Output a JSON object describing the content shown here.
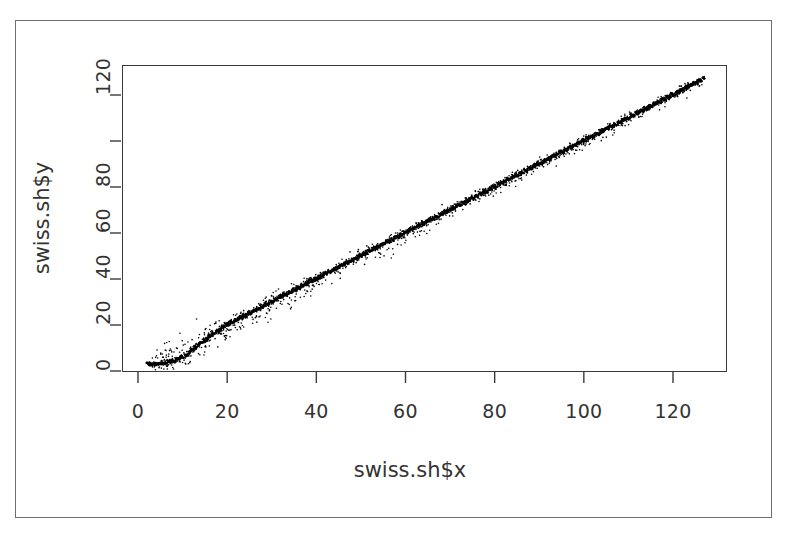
{
  "figure": {
    "background_color": "#ffffff",
    "frame_color": "#6e6e6e",
    "axis_color": "#3a3a3a",
    "point_color": "#000000"
  },
  "chart_data": {
    "type": "scatter",
    "title": "",
    "subtitle": "",
    "xlabel": "swiss.sh$x",
    "ylabel": "swiss.sh$y",
    "xlim": [
      -1,
      131
    ],
    "ylim": [
      -2,
      134
    ],
    "xticks": [
      0,
      20,
      40,
      60,
      80,
      100,
      120
    ],
    "xtick_labels": [
      "0",
      "20",
      "40",
      "60",
      "80",
      "100",
      "120"
    ],
    "yticks": [
      0,
      20,
      40,
      60,
      80,
      100,
      120
    ],
    "ytick_labels": [
      "0",
      "20",
      "40",
      "60",
      "80",
      "",
      "120"
    ],
    "grid": false,
    "legend": null,
    "annotations": [],
    "marker": "point",
    "marker_size_px": 1.6,
    "series": [
      {
        "name": "swiss.sh",
        "color": "#000000",
        "n_points": 1400,
        "x_range": [
          2,
          127
        ],
        "y_range": [
          1,
          127
        ],
        "trend": "linear",
        "slope": 1.0,
        "intercept": 0.0,
        "ridge_points": [
          [
            2,
            3
          ],
          [
            3,
            3
          ],
          [
            4,
            3
          ],
          [
            5,
            3
          ],
          [
            6,
            3
          ],
          [
            7,
            4
          ],
          [
            8,
            4
          ],
          [
            9,
            5
          ],
          [
            10,
            6
          ],
          [
            11,
            7
          ],
          [
            12,
            9
          ],
          [
            13,
            10
          ],
          [
            14,
            12
          ],
          [
            15,
            13
          ],
          [
            16,
            15
          ],
          [
            17,
            16
          ],
          [
            18,
            17
          ],
          [
            19,
            19
          ],
          [
            20,
            20
          ],
          [
            21,
            21
          ],
          [
            22,
            22
          ],
          [
            23,
            23
          ],
          [
            24,
            24
          ],
          [
            25,
            25
          ],
          [
            26,
            26
          ],
          [
            27,
            27
          ],
          [
            28,
            28
          ],
          [
            30,
            30
          ],
          [
            32,
            32
          ],
          [
            34,
            34
          ],
          [
            36,
            36
          ],
          [
            38,
            38
          ],
          [
            40,
            40
          ],
          [
            42,
            42
          ],
          [
            44,
            44
          ],
          [
            46,
            46
          ],
          [
            48,
            48
          ],
          [
            50,
            50
          ],
          [
            52,
            52
          ],
          [
            54,
            54
          ],
          [
            56,
            56
          ],
          [
            58,
            58
          ],
          [
            60,
            60
          ],
          [
            62,
            62
          ],
          [
            64,
            64
          ],
          [
            66,
            66
          ],
          [
            68,
            68
          ],
          [
            70,
            70
          ],
          [
            72,
            72
          ],
          [
            74,
            74
          ],
          [
            76,
            76
          ],
          [
            78,
            78
          ],
          [
            80,
            80
          ],
          [
            82,
            82
          ],
          [
            84,
            84
          ],
          [
            86,
            86
          ],
          [
            88,
            88
          ],
          [
            90,
            90
          ],
          [
            92,
            92
          ],
          [
            94,
            94
          ],
          [
            96,
            96
          ],
          [
            98,
            98
          ],
          [
            100,
            100
          ],
          [
            102,
            102
          ],
          [
            104,
            104
          ],
          [
            106,
            106
          ],
          [
            108,
            108
          ],
          [
            110,
            110
          ],
          [
            112,
            112
          ],
          [
            114,
            114
          ],
          [
            116,
            116
          ],
          [
            118,
            118
          ],
          [
            120,
            120
          ],
          [
            122,
            122
          ],
          [
            124,
            124
          ],
          [
            126,
            126
          ],
          [
            127,
            127
          ]
        ]
      }
    ]
  }
}
